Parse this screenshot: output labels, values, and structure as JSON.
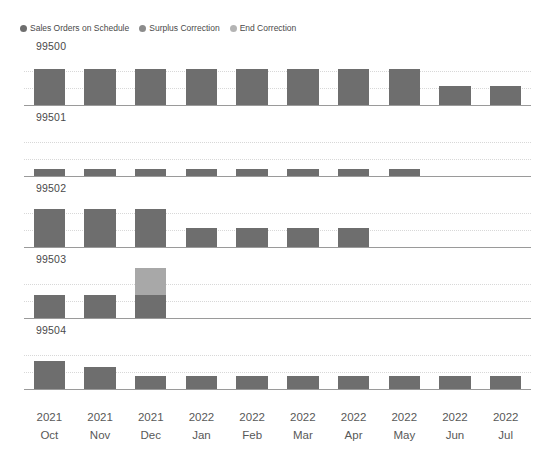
{
  "legend": {
    "position": "top-left",
    "items": [
      {
        "label": "Sales Orders on Schedule",
        "color": "#6e6e6e",
        "icon": "legend-dot-icon"
      },
      {
        "label": "Surplus Correction",
        "color": "#8c8c8c",
        "icon": "legend-dot-icon"
      },
      {
        "label": "End Correction",
        "color": "#b4b4b4",
        "icon": "legend-dot-icon"
      }
    ]
  },
  "colors": {
    "sales_orders_on_schedule": "#6e6e6e",
    "surplus_correction": "#a8a8a8",
    "end_correction": "#c9c9c9",
    "gridline": "#d8d8d8",
    "axis": "#9a9a9a",
    "text": "#4a4a4a"
  },
  "chart_data": {
    "type": "bar",
    "title": "",
    "subtitle": "",
    "xlabel": "",
    "ylabel": "",
    "layout": "small-multiples",
    "stacked": true,
    "grid": true,
    "gridlines_per_panel": 2,
    "legend_position": "top-left",
    "categories": [
      "2021 Oct",
      "2021 Nov",
      "2021 Dec",
      "2022 Jan",
      "2022 Feb",
      "2022 Mar",
      "2022 Apr",
      "2022 May",
      "2022 Jun",
      "2022 Jul"
    ],
    "category_years": [
      "2021",
      "2021",
      "2021",
      "2022",
      "2022",
      "2022",
      "2022",
      "2022",
      "2022",
      "2022"
    ],
    "category_months": [
      "Oct",
      "Nov",
      "Dec",
      "Jan",
      "Feb",
      "Mar",
      "Apr",
      "May",
      "Jun",
      "Jul"
    ],
    "ylim": [
      0,
      100
    ],
    "panels": [
      {
        "name": "99500",
        "series": [
          {
            "name": "Sales Orders on Schedule",
            "values": [
              72,
              72,
              72,
              72,
              72,
              72,
              72,
              72,
              38,
              38
            ]
          },
          {
            "name": "Surplus Correction",
            "values": [
              0,
              0,
              0,
              0,
              0,
              0,
              0,
              0,
              0,
              0
            ]
          },
          {
            "name": "End Correction",
            "values": [
              0,
              0,
              0,
              0,
              0,
              0,
              0,
              0,
              0,
              0
            ]
          }
        ]
      },
      {
        "name": "99501",
        "series": [
          {
            "name": "Sales Orders on Schedule",
            "values": [
              14,
              14,
              14,
              14,
              14,
              14,
              14,
              14,
              0,
              0
            ]
          },
          {
            "name": "Surplus Correction",
            "values": [
              0,
              0,
              0,
              0,
              0,
              0,
              0,
              0,
              0,
              0
            ]
          },
          {
            "name": "End Correction",
            "values": [
              0,
              0,
              0,
              0,
              0,
              0,
              0,
              0,
              0,
              0
            ]
          }
        ]
      },
      {
        "name": "99502",
        "series": [
          {
            "name": "Sales Orders on Schedule",
            "values": [
              76,
              76,
              76,
              38,
              38,
              38,
              38,
              0,
              0,
              0
            ]
          },
          {
            "name": "Surplus Correction",
            "values": [
              0,
              0,
              0,
              0,
              0,
              0,
              0,
              0,
              0,
              0
            ]
          },
          {
            "name": "End Correction",
            "values": [
              0,
              0,
              0,
              0,
              0,
              0,
              0,
              0,
              0,
              0
            ]
          }
        ]
      },
      {
        "name": "99503",
        "series": [
          {
            "name": "Sales Orders on Schedule",
            "values": [
              46,
              46,
              46,
              0,
              0,
              0,
              0,
              0,
              0,
              0
            ]
          },
          {
            "name": "Surplus Correction",
            "values": [
              0,
              0,
              54,
              0,
              0,
              0,
              0,
              0,
              0,
              0
            ]
          },
          {
            "name": "End Correction",
            "values": [
              0,
              0,
              0,
              0,
              0,
              0,
              0,
              0,
              0,
              0
            ]
          }
        ]
      },
      {
        "name": "99504",
        "series": [
          {
            "name": "Sales Orders on Schedule",
            "values": [
              56,
              44,
              26,
              26,
              26,
              26,
              26,
              26,
              26,
              26
            ]
          },
          {
            "name": "Surplus Correction",
            "values": [
              0,
              0,
              0,
              0,
              0,
              0,
              0,
              0,
              0,
              0
            ]
          },
          {
            "name": "End Correction",
            "values": [
              0,
              0,
              0,
              0,
              0,
              0,
              0,
              0,
              0,
              0
            ]
          }
        ]
      }
    ]
  }
}
